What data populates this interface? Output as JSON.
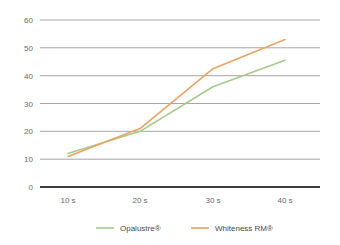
{
  "chart_data": {
    "type": "line",
    "title": "",
    "xlabel": "",
    "ylabel": "",
    "categories": [
      "10 s",
      "20 s",
      "30 s",
      "40 s"
    ],
    "ylim": [
      0,
      60
    ],
    "yticks": [
      0,
      10,
      20,
      30,
      40,
      50,
      60
    ],
    "ytick_labels": [
      "0",
      "10",
      "20",
      "30",
      "40",
      "50",
      "60"
    ],
    "grid": true,
    "grid_axis": "y",
    "legend_position": "bottom",
    "series": [
      {
        "name": "Opalustre®",
        "color": "#a9c98d",
        "values": [
          12,
          20,
          36,
          45.5
        ]
      },
      {
        "name": "Whiteness RM®",
        "color": "#e9a463",
        "values": [
          11,
          21,
          42.5,
          53
        ]
      }
    ]
  },
  "axes": {
    "y_tick_0": "0",
    "y_tick_1": "10",
    "y_tick_2": "20",
    "y_tick_3": "30",
    "y_tick_4": "40",
    "y_tick_5": "50",
    "y_tick_6": "60",
    "x_tick_0": "10 s",
    "x_tick_1": "20 s",
    "x_tick_2": "30 s",
    "x_tick_3": "40 s"
  },
  "legend": {
    "items": [
      {
        "label": "Opalustre®",
        "color": "#a9c98d"
      },
      {
        "label": "Whiteness RM®",
        "color": "#e9a463"
      }
    ]
  },
  "colors": {
    "gridline": "#a6a6a6",
    "axis": "#3d3d3d",
    "tick_text": "#6b6b6b",
    "legend_text": "#4a4a4a",
    "background": "#ffffff"
  }
}
